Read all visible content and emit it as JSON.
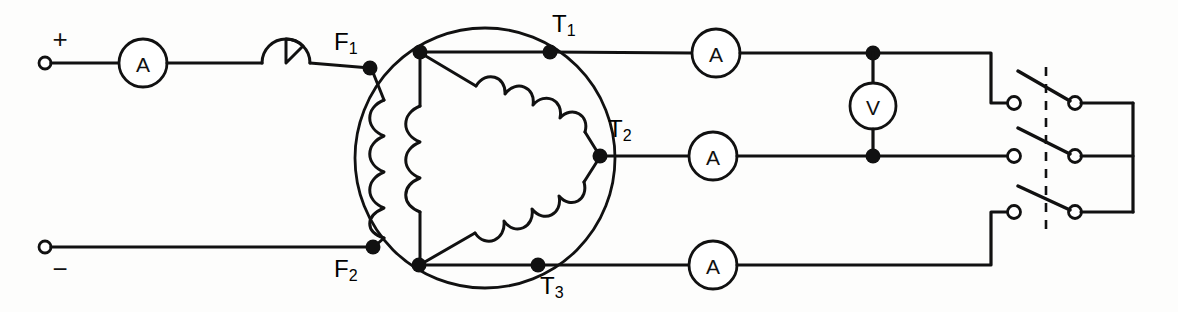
{
  "diagram": {
    "type": "electrical-schematic",
    "background_color": "#fdfdfc",
    "line_color": "#111111"
  },
  "dc_field_supply": {
    "positive_terminal_label": "+",
    "negative_terminal_label": "−",
    "field_ammeter": {
      "label": "A",
      "name": "field-ammeter"
    },
    "field_rheostat": {
      "name": "field-rheostat",
      "symbol": "circle-with-wedge"
    }
  },
  "machine": {
    "field_terminals": [
      {
        "label": "F",
        "subscript": "1"
      },
      {
        "label": "F",
        "subscript": "2"
      }
    ],
    "armature_terminals": [
      {
        "label": "T",
        "subscript": "1"
      },
      {
        "label": "T",
        "subscript": "2"
      },
      {
        "label": "T",
        "subscript": "3"
      }
    ],
    "field_winding_name": "field-coil",
    "delta_winding_name": "delta-armature-winding",
    "winding_connection": "delta"
  },
  "line_meters": {
    "ammeters": [
      {
        "label": "A",
        "name": "line-ammeter-1"
      },
      {
        "label": "A",
        "name": "line-ammeter-2"
      },
      {
        "label": "A",
        "name": "line-ammeter-3"
      }
    ],
    "voltmeter": {
      "label": "V",
      "name": "line-voltmeter"
    }
  },
  "switch": {
    "name": "three-pole-knife-switch",
    "poles": 3,
    "state": "open",
    "ganged": true
  },
  "load_bus": {
    "name": "load-bus",
    "conductors": 3
  }
}
